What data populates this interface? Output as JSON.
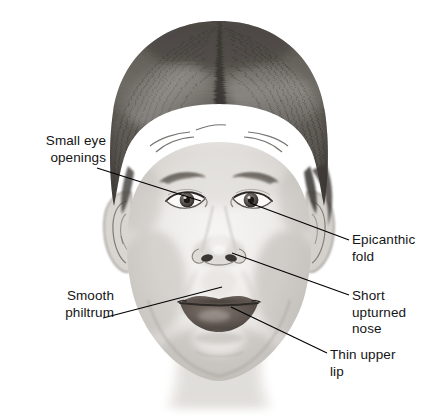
{
  "figure": {
    "background_color": "#ffffff",
    "text_color": "#141414",
    "leader_line_color": "#000000"
  },
  "callouts": [
    {
      "id": "small-eye-openings",
      "label": "Small eye\nopenings",
      "side": "left",
      "text_x": 14,
      "text_y": 133,
      "line_from": [
        97,
        168
      ],
      "line_to": [
        201,
        201
      ]
    },
    {
      "id": "smooth-philtrum",
      "label": "Smooth\nphiltrum",
      "side": "left",
      "text_x": 8,
      "text_y": 288,
      "line_from": [
        103,
        318
      ],
      "line_to": [
        222,
        287
      ]
    },
    {
      "id": "epicanthic-fold",
      "label": "Epicanthic\nfold",
      "side": "right",
      "text_x": 352,
      "text_y": 232,
      "line_from": [
        349,
        240
      ],
      "line_to": [
        250,
        203
      ]
    },
    {
      "id": "short-upturned-nose",
      "label": "Short\nupturned\nnose",
      "side": "right",
      "text_x": 352,
      "text_y": 288,
      "line_from": [
        349,
        295
      ],
      "line_to": [
        232,
        253
      ]
    },
    {
      "id": "thin-upper-lip",
      "label": "Thin upper\nlip",
      "side": "right",
      "text_x": 330,
      "text_y": 347,
      "line_from": [
        327,
        353
      ],
      "line_to": [
        231,
        307
      ]
    }
  ],
  "drawing_regions": [
    {
      "name": "hair",
      "description": "dark pencil-shaded hair with centre part"
    },
    {
      "name": "forehead",
      "description": "light shaded forehead"
    },
    {
      "name": "left-eye",
      "description": "small eye opening with iris and pupil"
    },
    {
      "name": "right-eye",
      "description": "small eye opening with iris and pupil"
    },
    {
      "name": "left-eyebrow",
      "description": "thin arched eyebrow"
    },
    {
      "name": "right-eyebrow",
      "description": "thin arched eyebrow"
    },
    {
      "name": "nose",
      "description": "short upturned nose with two nostrils"
    },
    {
      "name": "philtrum",
      "description": "smooth flat philtrum region"
    },
    {
      "name": "mouth",
      "description": "thin upper lip and fuller lower lip"
    },
    {
      "name": "chin",
      "description": "rounded shaded chin"
    },
    {
      "name": "left-ear",
      "description": "ear shown at side of head"
    },
    {
      "name": "right-ear",
      "description": "ear partly covered by hair"
    },
    {
      "name": "neck",
      "description": "faint neck shading below chin"
    }
  ]
}
